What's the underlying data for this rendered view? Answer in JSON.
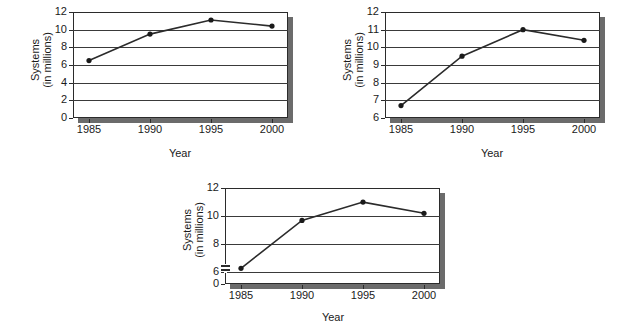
{
  "figure": {
    "background": "#ffffff",
    "line_color": "#2b2b2b",
    "marker_color": "#1a1a1a",
    "frame_color": "#2b2b2b",
    "shadow_color": "#6b6b6b",
    "grid_color": "#3a3a3a"
  },
  "chart_data": [
    {
      "id": "chart-top-left",
      "type": "line",
      "title": "",
      "xlabel": "Year",
      "ylabel": "Systems\n(in millions)",
      "ylabel_line1": "Systems",
      "ylabel_line2": "(in millions)",
      "x": [
        1985,
        1990,
        1995,
        2000
      ],
      "categories": [
        "1985",
        "1990",
        "1995",
        "2000"
      ],
      "values": [
        6.5,
        9.5,
        11.1,
        10.4
      ],
      "series": [
        {
          "name": "Systems",
          "values": [
            6.5,
            9.5,
            11.1,
            10.4
          ]
        }
      ],
      "xtick_labels": [
        "1985",
        "1990",
        "1995",
        "2000"
      ],
      "ytick_labels": [
        "0",
        "2",
        "4",
        "6",
        "8",
        "10",
        "12"
      ],
      "yticks": [
        0,
        2,
        4,
        6,
        8,
        10,
        12
      ],
      "ylim": [
        0,
        12
      ],
      "xlim": [
        1983.5,
        2001.5
      ],
      "grid": true,
      "axis_break": false,
      "legend": "none"
    },
    {
      "id": "chart-top-right",
      "type": "line",
      "title": "",
      "xlabel": "Year",
      "ylabel": "Systems\n(in millions)",
      "ylabel_line1": "Systems",
      "ylabel_line2": "(in millions)",
      "x": [
        1985,
        1990,
        1995,
        2000
      ],
      "categories": [
        "1985",
        "1990",
        "1995",
        "2000"
      ],
      "values": [
        6.7,
        9.5,
        11.0,
        10.4
      ],
      "series": [
        {
          "name": "Systems",
          "values": [
            6.7,
            9.5,
            11.0,
            10.4
          ]
        }
      ],
      "xtick_labels": [
        "1985",
        "1990",
        "1995",
        "2000"
      ],
      "ytick_labels": [
        "6",
        "7",
        "8",
        "9",
        "10",
        "11",
        "12"
      ],
      "yticks": [
        6,
        7,
        8,
        9,
        10,
        11,
        12
      ],
      "ylim": [
        6,
        12
      ],
      "xlim": [
        1983.5,
        2001.5
      ],
      "grid": true,
      "axis_break": false,
      "legend": "none"
    },
    {
      "id": "chart-bottom",
      "type": "line",
      "title": "",
      "xlabel": "Year",
      "ylabel": "Systems\n(in millions)",
      "ylabel_line1": "Systems",
      "ylabel_line2": "(in millions)",
      "x": [
        1985,
        1990,
        1995,
        2000
      ],
      "categories": [
        "1985",
        "1990",
        "1995",
        "2000"
      ],
      "values": [
        6.3,
        9.7,
        11.0,
        10.2
      ],
      "series": [
        {
          "name": "Systems",
          "values": [
            6.3,
            9.7,
            11.0,
            10.2
          ]
        }
      ],
      "xtick_labels": [
        "1985",
        "1990",
        "1995",
        "2000"
      ],
      "ytick_labels": [
        "0",
        "6",
        "8",
        "10",
        "12"
      ],
      "yticks": [
        0,
        6,
        8,
        10,
        12
      ],
      "ylim": [
        0,
        12
      ],
      "grid": true,
      "axis_break": true,
      "axis_break_between": [
        0,
        6
      ],
      "legend": "none"
    }
  ]
}
